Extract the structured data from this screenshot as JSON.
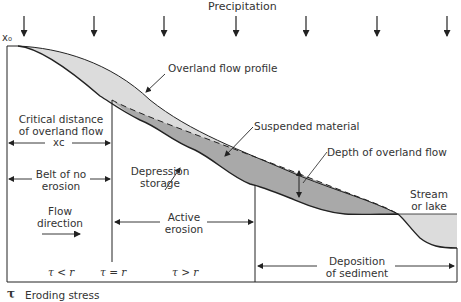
{
  "title": "Precipitation",
  "origin_label": "x₀",
  "labels": {
    "overland_flow_profile": "Overland flow profile",
    "suspended_material": "Suspended material",
    "depth_of_overland_flow": "Depth of overland flow",
    "depression_storage_1": "Depression",
    "depression_storage_2": "storage",
    "critical_distance_1": "Critical distance",
    "critical_distance_2": "of overland flow",
    "xc": "xᴄ",
    "belt_1": "Belt of no",
    "belt_2": "erosion",
    "flow_direction_1": "Flow",
    "flow_direction_2": "direction",
    "active_erosion_1": "Active",
    "active_erosion_2": "erosion",
    "stream_1": "Stream",
    "stream_2": "or lake",
    "deposition_1": "Deposition",
    "deposition_2": "of sediment",
    "tau_lt": "τ < r",
    "tau_eq": "τ = r",
    "tau_gt": "τ > r"
  },
  "legend": {
    "symbol": "τ",
    "text": "Eroding stress"
  },
  "colors": {
    "flow_fill": "#dcdcdc",
    "storage_fill": "#a9a9a9",
    "line": "#222222",
    "text": "#333333"
  },
  "precipitation_arrow_x": [
    24,
    94,
    164,
    236,
    306,
    377,
    447
  ]
}
